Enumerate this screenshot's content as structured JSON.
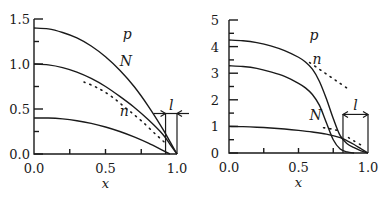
{
  "chart_data": [
    {
      "type": "line",
      "panel": "left",
      "xlabel": "x",
      "ylabel": "",
      "xlim": [
        0.0,
        1.0
      ],
      "ylim": [
        0.0,
        1.5
      ],
      "x_ticks": [
        "0.0",
        "0.5",
        "1.0"
      ],
      "y_ticks": [
        "0.0",
        "0.5",
        "1.0",
        "1.5"
      ],
      "grid": false,
      "annotation": {
        "label": "l",
        "from_x": 0.92,
        "to_x": 1.0,
        "y": 0.45
      },
      "series": [
        {
          "name": "p",
          "style": "solid",
          "x": [
            0.0,
            0.1,
            0.2,
            0.3,
            0.4,
            0.5,
            0.6,
            0.7,
            0.8,
            0.9,
            0.95,
            1.0
          ],
          "y": [
            1.4,
            1.39,
            1.35,
            1.29,
            1.2,
            1.08,
            0.93,
            0.75,
            0.53,
            0.28,
            0.14,
            0.0
          ]
        },
        {
          "name": "N",
          "style": "solid",
          "x": [
            0.0,
            0.1,
            0.2,
            0.3,
            0.4,
            0.5,
            0.6,
            0.7,
            0.8,
            0.9,
            0.95,
            1.0
          ],
          "y": [
            1.0,
            0.99,
            0.96,
            0.91,
            0.84,
            0.75,
            0.64,
            0.52,
            0.38,
            0.22,
            0.11,
            0.0
          ]
        },
        {
          "name": "n",
          "style": "solid",
          "x": [
            0.0,
            0.1,
            0.2,
            0.3,
            0.4,
            0.5,
            0.6,
            0.7,
            0.8,
            0.9,
            0.95
          ],
          "y": [
            0.4,
            0.4,
            0.39,
            0.37,
            0.34,
            0.3,
            0.25,
            0.19,
            0.12,
            0.04,
            0.0
          ]
        },
        {
          "name": "N-approx",
          "style": "dotted",
          "x": [
            0.35,
            0.45,
            0.55,
            0.65,
            0.75,
            0.85,
            0.92
          ],
          "y": [
            0.8,
            0.73,
            0.63,
            0.5,
            0.37,
            0.22,
            0.12
          ]
        }
      ]
    },
    {
      "type": "line",
      "panel": "right",
      "xlabel": "x",
      "ylabel": "",
      "xlim": [
        0.0,
        1.0
      ],
      "ylim": [
        0,
        5
      ],
      "x_ticks": [
        "0.0",
        "0.5",
        "1.0"
      ],
      "y_ticks": [
        "0",
        "1",
        "2",
        "3",
        "4",
        "5"
      ],
      "grid": false,
      "annotation": {
        "label": "l",
        "from_x": 0.82,
        "to_x": 1.0,
        "y": 1.45
      },
      "series": [
        {
          "name": "p",
          "style": "solid",
          "x": [
            0.0,
            0.1,
            0.2,
            0.3,
            0.4,
            0.5,
            0.55,
            0.6,
            0.65,
            0.7,
            0.75,
            0.8,
            0.85,
            0.9,
            0.95,
            1.0
          ],
          "y": [
            4.25,
            4.22,
            4.15,
            4.03,
            3.85,
            3.6,
            3.42,
            3.15,
            2.7,
            2.05,
            1.3,
            0.65,
            0.35,
            0.2,
            0.08,
            0.0
          ]
        },
        {
          "name": "n",
          "style": "solid",
          "x": [
            0.0,
            0.1,
            0.2,
            0.3,
            0.4,
            0.5,
            0.55,
            0.6,
            0.65,
            0.7,
            0.75,
            0.8,
            0.85,
            0.9
          ],
          "y": [
            3.28,
            3.25,
            3.18,
            3.05,
            2.88,
            2.62,
            2.45,
            2.2,
            1.8,
            1.15,
            0.5,
            0.15,
            0.04,
            0.0
          ]
        },
        {
          "name": "N",
          "style": "solid",
          "x": [
            0.0,
            0.1,
            0.2,
            0.3,
            0.4,
            0.5,
            0.6,
            0.7,
            0.8,
            0.85,
            0.9,
            0.95,
            1.0
          ],
          "y": [
            1.0,
            0.99,
            0.97,
            0.94,
            0.9,
            0.85,
            0.79,
            0.71,
            0.58,
            0.46,
            0.32,
            0.16,
            0.0
          ]
        },
        {
          "name": "p-approx",
          "style": "dotted",
          "x": [
            0.58,
            0.65,
            0.72,
            0.79,
            0.86
          ],
          "y": [
            3.4,
            3.15,
            2.9,
            2.65,
            2.4
          ]
        },
        {
          "name": "N-approx",
          "style": "dotted",
          "x": [
            0.68,
            0.74,
            0.8
          ],
          "y": [
            0.95,
            0.9,
            0.82
          ]
        },
        {
          "name": "N-tail-approx",
          "style": "dotted",
          "x": [
            0.86,
            0.9,
            0.95
          ],
          "y": [
            0.58,
            0.45,
            0.3
          ]
        }
      ]
    }
  ]
}
